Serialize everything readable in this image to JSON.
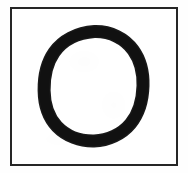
{
  "canvas": {
    "width": 188,
    "height": 173,
    "background_color": "#ffffff",
    "description": "Scanned card showing a hand-drawn circle inside a thin rectangular frame"
  },
  "frame": {
    "name": "rectangular-border",
    "shape": "rectangle",
    "stroke_color": "#262626",
    "stroke_width": 2,
    "left": 10,
    "top": 7,
    "width": 168,
    "height": 159,
    "fill_color": "#ffffff"
  },
  "paper": {
    "name": "paper-sheet",
    "color": "#fefefe",
    "texture": "faint scan grain"
  },
  "symbol": {
    "name": "hand-drawn-circle",
    "glyph": "O",
    "shape": "ring",
    "stroke_color": "#1a1a1a",
    "stroke_width": 13,
    "center_x": 94,
    "center_y": 87,
    "radius_x": 43,
    "radius_y": 49,
    "bbox": {
      "left": 44,
      "top": 31,
      "right": 143,
      "bottom": 143
    },
    "style": "hand drawn, slightly irregular, closed loop"
  },
  "caption": {
    "alt_text": "A hand-drawn circle outline centered within a thin square border on white paper"
  }
}
